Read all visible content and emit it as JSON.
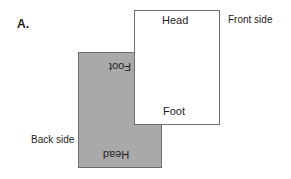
{
  "panel": {
    "label": "A."
  },
  "back_sheet": {
    "top_text": "Foot",
    "bottom_text": "Head",
    "label": "Back side",
    "color": "#a9a9a9"
  },
  "front_sheet": {
    "top_text": "Head",
    "bottom_text": "Foot",
    "label": "Front side",
    "color": "#ffffff"
  }
}
